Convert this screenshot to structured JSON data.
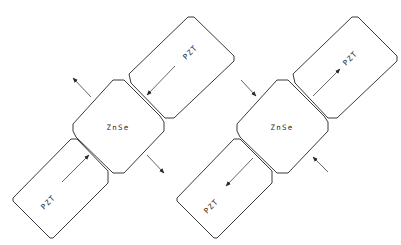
{
  "diagram": {
    "colors": {
      "line": "#3a3a3a",
      "arrow": "#2a2a2a",
      "background": "#ffffff"
    },
    "panels": [
      {
        "id": "left",
        "crystal_label": "ZnSe",
        "pzt_top_label": "PZT",
        "pzt_bottom_label": "PZT",
        "pzt_arrow_direction": "toward crystal (compression)",
        "external_arrow_direction": "away from crystal (expansion)"
      },
      {
        "id": "right",
        "crystal_label": "ZnSe",
        "pzt_top_label": "PZT",
        "pzt_bottom_label": "PZT",
        "pzt_arrow_direction": "away from crystal (extension)",
        "external_arrow_direction": "toward crystal (compression)"
      }
    ]
  }
}
